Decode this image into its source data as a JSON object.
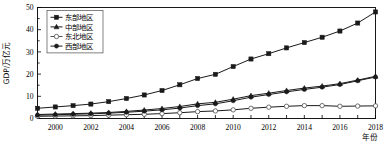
{
  "chart_data": {
    "type": "line",
    "title": "",
    "xlabel": "年份",
    "ylabel": "GDP/万亿元",
    "xlim": [
      1999,
      2018
    ],
    "ylim": [
      0,
      50
    ],
    "yticks": [
      0,
      10,
      20,
      30,
      40,
      50
    ],
    "xticks": [
      2000,
      2002,
      2004,
      2006,
      2008,
      2010,
      2012,
      2014,
      2016,
      2018
    ],
    "x": [
      1999,
      2000,
      2001,
      2002,
      2003,
      2004,
      2005,
      2006,
      2007,
      2008,
      2009,
      2010,
      2011,
      2012,
      2013,
      2014,
      2015,
      2016,
      2017,
      2018
    ],
    "grid": false,
    "legend_position": "top-left",
    "series": [
      {
        "name": "东部地区",
        "marker": "filled-square",
        "color": "#1a1a1a",
        "values": [
          4.6,
          5.2,
          5.8,
          6.5,
          7.6,
          9.0,
          10.6,
          12.6,
          15.2,
          18.0,
          19.9,
          23.4,
          26.8,
          29.2,
          31.8,
          34.2,
          36.6,
          39.4,
          43.0,
          48.0
        ]
      },
      {
        "name": "中部地区",
        "marker": "filled-triangle",
        "color": "#1a1a1a",
        "values": [
          1.8,
          2.0,
          2.2,
          2.4,
          2.7,
          3.2,
          3.8,
          4.5,
          5.4,
          6.6,
          7.3,
          8.7,
          10.3,
          11.4,
          12.6,
          13.7,
          14.6,
          15.7,
          17.3,
          19.0
        ]
      },
      {
        "name": "东北地区",
        "marker": "open-circle",
        "color": "#4d4d4d",
        "values": [
          1.0,
          1.1,
          1.2,
          1.3,
          1.5,
          1.7,
          1.9,
          2.2,
          2.6,
          3.1,
          3.4,
          3.9,
          4.6,
          5.1,
          5.5,
          5.8,
          5.8,
          5.5,
          5.6,
          5.7
        ]
      },
      {
        "name": "西部地区",
        "marker": "filled-circle",
        "color": "#1a1a1a",
        "values": [
          1.5,
          1.7,
          1.9,
          2.1,
          2.4,
          2.8,
          3.3,
          3.9,
          4.7,
          5.8,
          6.6,
          8.0,
          9.6,
          10.8,
          12.0,
          13.1,
          14.1,
          15.3,
          17.0,
          18.7
        ]
      }
    ]
  },
  "legend": {
    "items": [
      {
        "label": "东部地区"
      },
      {
        "label": "中部地区"
      },
      {
        "label": "东北地区"
      },
      {
        "label": "西部地区"
      }
    ]
  },
  "axes": {
    "y_title": "GDP/万亿元",
    "x_title": "年份"
  }
}
